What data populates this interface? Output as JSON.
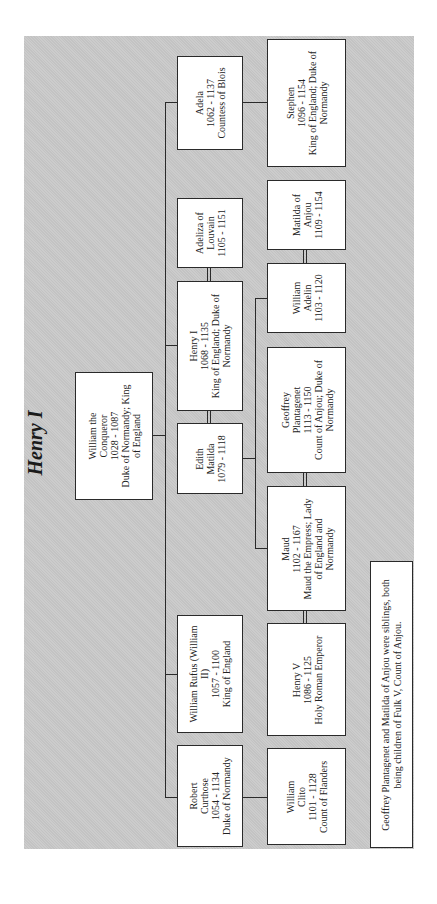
{
  "title": "Henry I",
  "colors": {
    "background_panel": "#c9c9c9",
    "box_fill": "#ffffff",
    "line": "#2a2a2a",
    "text": "#222222"
  },
  "orientation": "rotated 90 degrees counter-clockwise",
  "root": {
    "name": "William the Conqueror",
    "lines": [
      "William the",
      "Conqueror",
      "1028 - 1087",
      "Duke of Normandy; King",
      "of England"
    ]
  },
  "generation2": [
    {
      "id": "adela",
      "lines": [
        "Adela",
        "1062 - 1137",
        "Countess of Blois"
      ]
    },
    {
      "id": "adeliza",
      "lines": [
        "Adeliza of",
        "Louvain",
        "1105 - 1151"
      ]
    },
    {
      "id": "henry1",
      "lines": [
        "Henry I",
        "1068 - 1135",
        "King of England; Duke of",
        "Normandy"
      ]
    },
    {
      "id": "edith",
      "lines": [
        "Edith",
        "Matilda",
        "1079 - 1118"
      ]
    },
    {
      "id": "rufus",
      "lines": [
        "William Rufus (William",
        "II)",
        "1057 - 1100",
        "King of England"
      ]
    },
    {
      "id": "robert",
      "lines": [
        "Robert",
        "Curthose",
        "1054 - 1134",
        "Duke of Normandy"
      ]
    }
  ],
  "generation3": [
    {
      "id": "stephen",
      "lines": [
        "Stephen",
        "1096 - 1154",
        "King of England; Duke of",
        "Normandy"
      ]
    },
    {
      "id": "matilda_anjou",
      "lines": [
        "Matilda of",
        "Anjou",
        "1109 - 1154"
      ]
    },
    {
      "id": "william_adelin",
      "lines": [
        "William",
        "Adelin",
        "1103 - 1120"
      ]
    },
    {
      "id": "geoffrey",
      "lines": [
        "Geoffrey",
        "Plantagenet",
        "1113 - 1150",
        "Count of Anjou; Duke of",
        "Normandy"
      ]
    },
    {
      "id": "maud",
      "lines": [
        "Maud",
        "1102 - 1167",
        "Maud the Empress; Lady",
        "of England and",
        "Normandy"
      ]
    },
    {
      "id": "henry5",
      "lines": [
        "Henry V",
        "1086 - 1125",
        "Holy Roman Emperor"
      ]
    },
    {
      "id": "clito",
      "lines": [
        "William",
        "Clito",
        "1101 - 1128",
        "Count of Flanders"
      ]
    }
  ],
  "note": {
    "lines": [
      "Geoffrey Plantagenet and Matilda of Anjou were siblings, both",
      "being children of Fulk V, Count of Anjou."
    ]
  }
}
